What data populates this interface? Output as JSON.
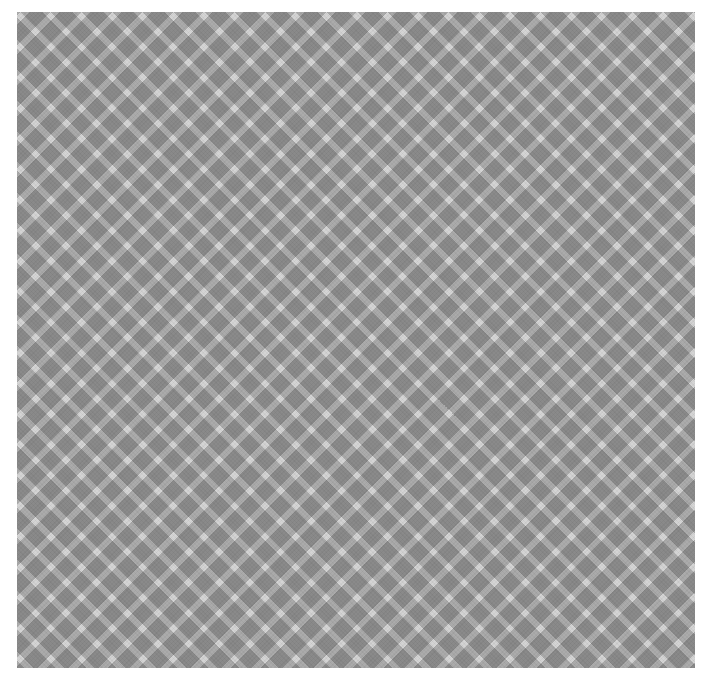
{
  "canvas": {
    "width": 706,
    "height": 680,
    "background_color": "#ffffff"
  },
  "pattern": {
    "name": "diagonal-gingham-plaid",
    "region": {
      "left": 17,
      "top": 12,
      "width": 678,
      "height": 656
    },
    "colors": {
      "lightest": "#d4d4d4",
      "mid": "#ababab",
      "darkest": "#808080",
      "background": "#ffffff"
    },
    "stripe_angle_degrees": 45,
    "stripe_pitch_px": 21.64,
    "stripe_width_px": 15.3,
    "gap_width_px": 6.3,
    "cell_period_px": 15.3,
    "texture": "crosshatch-weave"
  },
  "axis": {
    "tick_labels": [
      "",
      "",
      "",
      "",
      ""
    ],
    "visible_fragment_note": "clipped-at-left-edge"
  }
}
